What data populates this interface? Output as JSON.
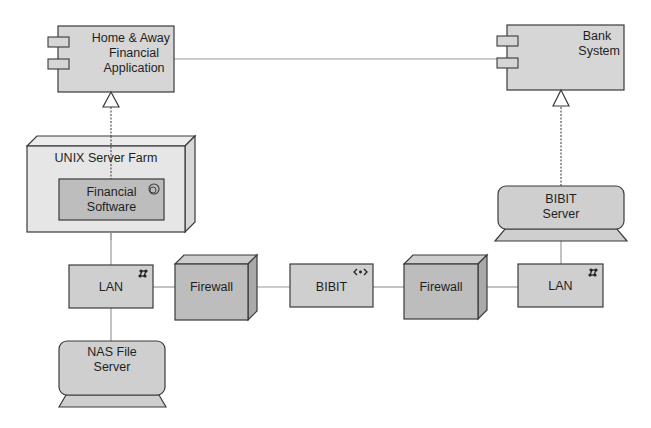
{
  "diagram": {
    "type": "UML deployment diagram",
    "colors": {
      "background": "#ffffff",
      "component_fill": "#d6d6d6",
      "node_fill_light": "#e4e4e4",
      "node_fill_dark": "#bdbdbd",
      "stroke": "#3a3a3a",
      "connector": "#9a9a9a"
    },
    "nodes": {
      "home_away": {
        "kind": "component",
        "label_lines": [
          "Home & Away",
          "Financial",
          "Application"
        ]
      },
      "bank_system": {
        "kind": "component",
        "label_lines": [
          "Bank",
          "System"
        ]
      },
      "unix_farm": {
        "kind": "node-3d",
        "label": "UNIX Server Farm"
      },
      "financial_software": {
        "kind": "active-object",
        "label_lines": [
          "Financial",
          "Software"
        ],
        "icon": "active-object-icon"
      },
      "bibit_server": {
        "kind": "device",
        "label_lines": [
          "BIBIT",
          "Server"
        ]
      },
      "lan_left": {
        "kind": "network",
        "label": "LAN",
        "icon": "network-icon"
      },
      "firewall_left": {
        "kind": "node-3d",
        "label": "Firewall"
      },
      "bibit": {
        "kind": "interface",
        "label": "BIBIT",
        "icon": "interface-icon"
      },
      "firewall_right": {
        "kind": "node-3d",
        "label": "Firewall"
      },
      "lan_right": {
        "kind": "network",
        "label": "LAN",
        "icon": "network-icon"
      },
      "nas": {
        "kind": "device",
        "label_lines": [
          "NAS File",
          "Server"
        ]
      }
    },
    "edges": [
      {
        "from": "home_away",
        "to": "bank_system",
        "style": "solid"
      },
      {
        "from": "financial_software",
        "to": "home_away",
        "style": "dotted-realization"
      },
      {
        "from": "bibit_server",
        "to": "bank_system",
        "style": "dotted-realization"
      },
      {
        "from": "unix_farm",
        "to": "lan_left",
        "style": "solid"
      },
      {
        "from": "lan_left",
        "to": "nas",
        "style": "solid"
      },
      {
        "from": "lan_left",
        "to": "firewall_left",
        "style": "solid"
      },
      {
        "from": "firewall_left",
        "to": "bibit",
        "style": "solid"
      },
      {
        "from": "bibit",
        "to": "firewall_right",
        "style": "solid"
      },
      {
        "from": "firewall_right",
        "to": "lan_right",
        "style": "solid"
      },
      {
        "from": "lan_right",
        "to": "bibit_server",
        "style": "solid"
      }
    ]
  }
}
